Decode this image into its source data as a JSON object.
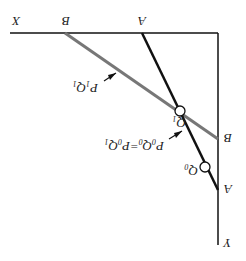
{
  "diagram": {
    "orientation": "rotated 180 degrees",
    "axes": {
      "x_label": "X",
      "y_label": "Y"
    },
    "lines": [
      {
        "name": "budget-line-A",
        "x_intercept_label": "A",
        "y_intercept_label": "A",
        "color": "#111111"
      },
      {
        "name": "budget-line-B",
        "x_intercept_label": "B",
        "y_intercept_label": "B",
        "color": "#777777"
      }
    ],
    "points": [
      {
        "label": "Q",
        "subscript": "0"
      },
      {
        "label": "Q",
        "subscript": "1"
      }
    ],
    "annotations": {
      "p1q1": {
        "p": "P",
        "p_sub": "1",
        "q": "Q",
        "q_sub": "1"
      },
      "p0q0": {
        "text": "P",
        "s1": "0",
        "q": "Q",
        "s2": "0",
        "eq": "=P",
        "s3": "0",
        "q2": "Q",
        "s4": "1"
      }
    }
  }
}
